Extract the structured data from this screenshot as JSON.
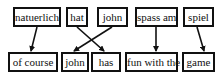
{
  "diagram": {
    "type": "word-alignment",
    "source_row": [
      {
        "id": "s0",
        "label": "natuerlich",
        "x": 13,
        "y": 7,
        "w": 48,
        "h": 20
      },
      {
        "id": "s1",
        "label": "hat",
        "x": 66,
        "y": 7,
        "w": 22,
        "h": 20
      },
      {
        "id": "s2",
        "label": "john",
        "x": 97,
        "y": 7,
        "w": 31,
        "h": 20
      },
      {
        "id": "s3",
        "label": "spass am",
        "x": 135,
        "y": 7,
        "w": 43,
        "h": 20
      },
      {
        "id": "s4",
        "label": "spiel",
        "x": 183,
        "y": 7,
        "w": 31,
        "h": 20
      }
    ],
    "target_row": [
      {
        "id": "t0",
        "label": "of course",
        "x": 8,
        "y": 52,
        "w": 50,
        "h": 20
      },
      {
        "id": "t1",
        "label": "john",
        "x": 61,
        "y": 52,
        "w": 28,
        "h": 20
      },
      {
        "id": "t2",
        "label": "has",
        "x": 91,
        "y": 52,
        "w": 30,
        "h": 20
      },
      {
        "id": "t3",
        "label": "fun with the",
        "x": 125,
        "y": 52,
        "w": 53,
        "h": 20
      },
      {
        "id": "t4",
        "label": "game",
        "x": 182,
        "y": 52,
        "w": 33,
        "h": 20
      }
    ],
    "alignments": [
      {
        "from": "natuerlich",
        "to": "of course",
        "x1": 37,
        "y1": 27,
        "x2": 31,
        "y2": 51
      },
      {
        "from": "hat",
        "to": "has",
        "x1": 77,
        "y1": 27,
        "x2": 104,
        "y2": 51
      },
      {
        "from": "john",
        "to": "john",
        "x1": 112,
        "y1": 27,
        "x2": 74,
        "y2": 51
      },
      {
        "from": "spass am",
        "to": "fun with the",
        "x1": 156,
        "y1": 27,
        "x2": 156,
        "y2": 51
      },
      {
        "from": "spiel",
        "to": "game",
        "x1": 197,
        "y1": 27,
        "x2": 204,
        "y2": 51
      }
    ]
  }
}
